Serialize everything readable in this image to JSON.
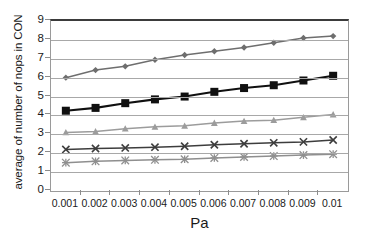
{
  "chart_data": {
    "type": "line",
    "title": "",
    "xlabel": "Pa",
    "ylabel": "average of number of nops in CON",
    "categories": [
      "0.001",
      "0.002",
      "0.003",
      "0.004",
      "0.005",
      "0.006",
      "0.007",
      "0.008",
      "0.009",
      "0.01"
    ],
    "x": [
      0.001,
      0.002,
      0.003,
      0.004,
      0.005,
      0.006,
      0.007,
      0.008,
      0.009,
      0.01
    ],
    "ylim": [
      0,
      9
    ],
    "ytick_labels": [
      "0",
      "1",
      "2",
      "3",
      "4",
      "5",
      "6",
      "7",
      "8",
      "9"
    ],
    "yticks": [
      0,
      1,
      2,
      3,
      4,
      5,
      6,
      7,
      8,
      9
    ],
    "grid": "horizontal",
    "legend": "none",
    "series": [
      {
        "name": "series-1",
        "marker": "diamond",
        "color": "#6e6e6e",
        "values": [
          6.0,
          6.4,
          6.6,
          6.95,
          7.2,
          7.4,
          7.6,
          7.85,
          8.1,
          8.2
        ]
      },
      {
        "name": "series-2",
        "marker": "square",
        "color": "#101010",
        "values": [
          4.25,
          4.4,
          4.65,
          4.85,
          5.0,
          5.25,
          5.45,
          5.6,
          5.85,
          6.1
        ]
      },
      {
        "name": "series-3",
        "marker": "triangle",
        "color": "#9c9c9c",
        "values": [
          3.1,
          3.15,
          3.3,
          3.4,
          3.45,
          3.6,
          3.7,
          3.75,
          3.9,
          4.05
        ]
      },
      {
        "name": "series-4",
        "marker": "x",
        "color": "#3d3d3d",
        "values": [
          2.2,
          2.25,
          2.28,
          2.32,
          2.37,
          2.45,
          2.5,
          2.55,
          2.6,
          2.7
        ]
      },
      {
        "name": "series-5",
        "marker": "asterisk",
        "color": "#8f8f8f",
        "values": [
          1.5,
          1.57,
          1.62,
          1.65,
          1.68,
          1.75,
          1.8,
          1.85,
          1.9,
          1.95
        ]
      }
    ]
  },
  "axes": {
    "y_title": "average of number of nops in CON",
    "x_title": "Pa"
  },
  "colors": {
    "gridline": "#a8a8a8",
    "frame": "#9a9a9a",
    "top_frame": "#3b3b3b",
    "text": "#1a1a1a",
    "background": "#ffffff"
  }
}
